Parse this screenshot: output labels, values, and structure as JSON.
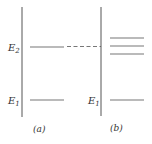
{
  "diagram": {
    "type": "energy-level-diagram",
    "panels": [
      {
        "id": "a",
        "caption": "(a)",
        "levels": [
          {
            "label": "E",
            "subscript": "2",
            "style": "solid"
          },
          {
            "label": "E",
            "subscript": "1",
            "style": "solid"
          }
        ]
      },
      {
        "id": "b",
        "caption": "(b)",
        "levels": [
          {
            "label": "",
            "subscript": "",
            "style": "solid",
            "note": "split level (upper)"
          },
          {
            "label": "",
            "subscript": "",
            "style": "solid",
            "note": "split level (middle)"
          },
          {
            "label": "",
            "subscript": "",
            "style": "solid",
            "note": "split level (lower)"
          },
          {
            "label": "E",
            "subscript": "1",
            "style": "solid"
          }
        ]
      }
    ],
    "connector": {
      "from": "a.E2",
      "to": "b.split-levels",
      "style": "dashed"
    },
    "colors": {
      "axis": "#444444",
      "level": "#777777",
      "text": "#333333"
    }
  }
}
